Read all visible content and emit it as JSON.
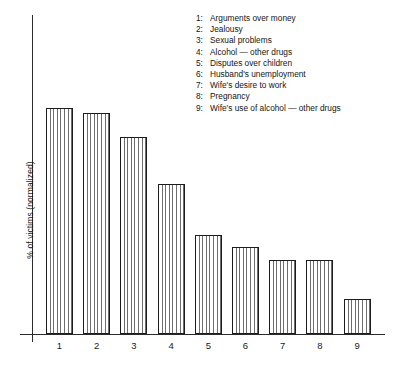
{
  "chart_data": {
    "type": "bar",
    "title": "",
    "subtitle": "",
    "xlabel": "",
    "ylabel": "% of victims (normalized)",
    "categories": [
      "1",
      "2",
      "3",
      "4",
      "5",
      "6",
      "7",
      "8",
      "9"
    ],
    "values": [
      100,
      97.8,
      87.2,
      66.4,
      43.8,
      38.5,
      32.7,
      32.7,
      15.5
    ],
    "ylim": [
      0,
      112
    ],
    "grid": false,
    "legend_position": "top-right",
    "series": [
      {
        "name": "% of victims (normalized)",
        "values": [
          100,
          97.8,
          87.2,
          66.4,
          43.8,
          38.5,
          32.7,
          32.7,
          15.5
        ]
      }
    ],
    "legend_entries": [
      {
        "key": "1:",
        "label": "Arguments over money"
      },
      {
        "key": "2:",
        "label": "Jealousy"
      },
      {
        "key": "3:",
        "label": "Sexual problems"
      },
      {
        "key": "4:",
        "label": "Alcohol — other drugs"
      },
      {
        "key": "5:",
        "label": "Disputes over children"
      },
      {
        "key": "6:",
        "label": "Husband's unemployment"
      },
      {
        "key": "7:",
        "label": "Wife's desire to work"
      },
      {
        "key": "8:",
        "label": "Pregnancy"
      },
      {
        "key": "9:",
        "label": "Wife's use of alcohol — other drugs"
      }
    ],
    "tick_labels": [
      "1",
      "2",
      "3",
      "4",
      "5",
      "6",
      "7",
      "8",
      "9"
    ],
    "colors": {
      "axis": "#2b2b2b",
      "bar_outline": "#1c1c1c",
      "bar_hatch": "#6d6d6d",
      "bar_fill": "#ffffff",
      "text": "#1a1a1a",
      "background": "#ffffff"
    }
  },
  "axes": {
    "y_title": "% of victims (normalized)"
  }
}
